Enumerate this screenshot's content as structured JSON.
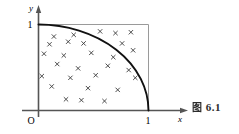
{
  "figure": {
    "caption_prefix": "图",
    "caption_number": "6.1",
    "caption_full": "图 6.1"
  },
  "axes": {
    "x_label": "x",
    "y_label": "y",
    "origin_label": "O",
    "x_tick_label": "1",
    "y_tick_label": "1",
    "x_range": [
      0,
      1
    ],
    "y_range": [
      0,
      1
    ]
  },
  "chart_data": {
    "type": "scatter",
    "title": "",
    "xlabel": "x",
    "ylabel": "y",
    "xlim": [
      0,
      1
    ],
    "ylim": [
      0,
      1
    ],
    "grid": false,
    "legend": null,
    "annotations": [
      "unit square boundary",
      "quarter circle arc x^2 + y^2 = 1"
    ],
    "curve": {
      "name": "quarter-circle",
      "equation": "x^2 + y^2 = 1",
      "from": [
        0,
        1
      ],
      "to": [
        1,
        0
      ]
    },
    "marker": "x",
    "point_count": 28,
    "points": [
      [
        0.14,
        0.86
      ],
      [
        0.32,
        0.88
      ],
      [
        0.56,
        0.92
      ],
      [
        0.7,
        0.9
      ],
      [
        0.84,
        0.91
      ],
      [
        0.1,
        0.77
      ],
      [
        0.27,
        0.8
      ],
      [
        0.41,
        0.78
      ],
      [
        0.76,
        0.78
      ],
      [
        0.05,
        0.66
      ],
      [
        0.23,
        0.64
      ],
      [
        0.48,
        0.67
      ],
      [
        0.68,
        0.62
      ],
      [
        0.86,
        0.7
      ],
      [
        0.17,
        0.54
      ],
      [
        0.36,
        0.49
      ],
      [
        0.63,
        0.52
      ],
      [
        0.82,
        0.47
      ],
      [
        0.03,
        0.4
      ],
      [
        0.29,
        0.38
      ],
      [
        0.52,
        0.41
      ],
      [
        0.88,
        0.38
      ],
      [
        0.12,
        0.28
      ],
      [
        0.45,
        0.26
      ],
      [
        0.72,
        0.24
      ],
      [
        0.25,
        0.13
      ],
      [
        0.39,
        0.12
      ],
      [
        0.6,
        0.11
      ]
    ]
  },
  "colors": {
    "ink": "#1a1a1a",
    "frame": "#8a8a8a",
    "curve": "#111111",
    "marker": "#3a3a3a",
    "background": "#ffffff"
  }
}
